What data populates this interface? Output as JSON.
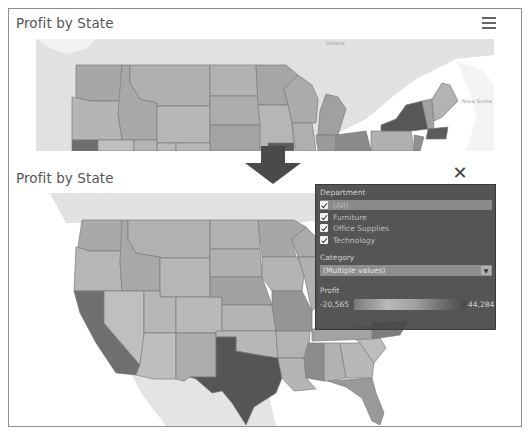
{
  "top_view": {
    "title": "Profit by State",
    "menu_icon": "hamburger-menu-icon",
    "map_labels": [
      "Ontario",
      "Nova Scotia"
    ]
  },
  "transition": {
    "icon": "down-arrow-icon"
  },
  "bottom_view": {
    "title": "Profit by State",
    "close_icon": "close-icon"
  },
  "filter_panel": {
    "department": {
      "label": "Department",
      "options": [
        {
          "label": "(All)",
          "checked": true,
          "selected": true
        },
        {
          "label": "Furniture",
          "checked": true
        },
        {
          "label": "Office Supplies",
          "checked": true
        },
        {
          "label": "Technology",
          "checked": true
        }
      ]
    },
    "category": {
      "label": "Category",
      "value": "(Multiple values)",
      "dropdown_icon": "dropdown-arrow-icon"
    },
    "profit": {
      "label": "Profit",
      "min": "-20,565",
      "max": "44,284"
    }
  },
  "colors": {
    "frame_border": "#8f8f8f",
    "title_text": "#555555",
    "panel_bg": "#484848",
    "land": "#dcdcdc",
    "state_default": "#b3b3b3",
    "state_border": "#7a7a7a",
    "high_profit": "#4f4f4f",
    "arrow": "#4a4a4a"
  }
}
